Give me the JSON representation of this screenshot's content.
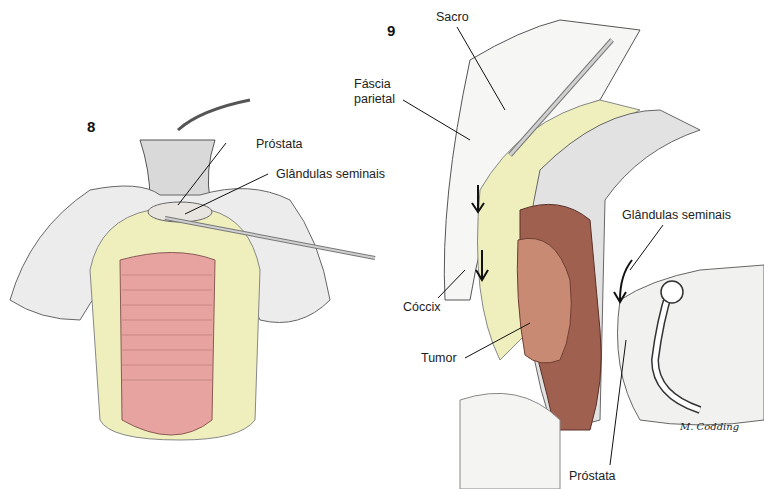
{
  "figures": [
    {
      "number": "8",
      "labels": [
        {
          "id": "prostata",
          "text": "Próstata"
        },
        {
          "id": "glandulas",
          "text": "Glândulas seminais"
        }
      ]
    },
    {
      "number": "9",
      "labels": [
        {
          "id": "sacro",
          "text": "Sacro"
        },
        {
          "id": "fascia",
          "text": "Fáscia\nparietal",
          "line1": "Fáscia",
          "line2": "parietal"
        },
        {
          "id": "coccix",
          "text": "Cóccix"
        },
        {
          "id": "tumor",
          "text": "Tumor"
        },
        {
          "id": "glandulas",
          "text": "Glândulas seminais"
        },
        {
          "id": "prostata",
          "text": "Próstata"
        }
      ],
      "signature": "M. Codding"
    }
  ],
  "colors": {
    "fat": "#efeebd",
    "rectum": "#e6a3a0",
    "tumor_wall": "#a0604f",
    "tumor": "#c88a72",
    "tissue_line": "#555555",
    "instrument": "#bdbdbd"
  }
}
